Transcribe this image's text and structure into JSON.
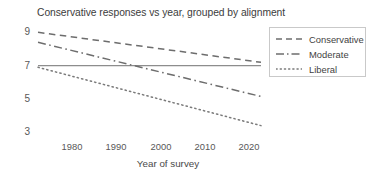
{
  "chart_data": {
    "type": "line",
    "title": "Conservative responses vs year, grouped by alignment",
    "xlabel": "Year of survey",
    "ylabel": "",
    "xlim": [
      1973,
      2024
    ],
    "ylim": [
      2.2,
      9.6
    ],
    "xticks": [
      1980,
      1990,
      2000,
      2010,
      2020
    ],
    "yticks": [
      3,
      5,
      7,
      9
    ],
    "grid": false,
    "legend_position": "upper right",
    "series": [
      {
        "name": "Conservative",
        "linestyle": "dashed",
        "x": [
          1975,
          2022
        ],
        "values": [
          9.0,
          7.2
        ]
      },
      {
        "name": "Moderate",
        "linestyle": "dash-dot",
        "x": [
          1975,
          2022
        ],
        "values": [
          8.4,
          5.15
        ]
      },
      {
        "name": "Liberal",
        "linestyle": "dotted",
        "x": [
          1975,
          2022
        ],
        "values": [
          6.9,
          3.4
        ]
      }
    ],
    "reference_line": {
      "name": "overall",
      "linestyle": "solid",
      "x": [
        1975,
        2022
      ],
      "values": [
        7.0,
        7.0
      ]
    }
  },
  "axes": {
    "ytick_labels": [
      "9",
      "7",
      "5",
      "3"
    ],
    "xtick_labels": [
      "1980",
      "1990",
      "2000",
      "2010",
      "2020"
    ]
  },
  "legend": {
    "entries": [
      {
        "label": "Conservative"
      },
      {
        "label": "Moderate"
      },
      {
        "label": "Liberal"
      }
    ]
  },
  "colors": {
    "line": "#6b6b6b",
    "reference": "#8d8d8d",
    "text": "#3c3c3c",
    "tick": "#585858",
    "legend_border": "#c9c9c9",
    "background": "#ffffff"
  }
}
